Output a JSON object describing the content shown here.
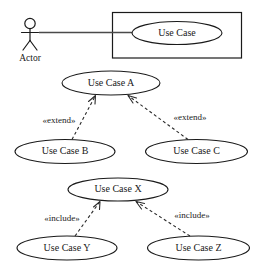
{
  "diagram": {
    "type": "use-case-diagram",
    "colors": {
      "background": "#ffffff",
      "stroke": "#1a1a1a",
      "association": "#4a4a4a",
      "dependency": "#2a2a2a"
    }
  },
  "section_actor": {
    "actor": {
      "name": "Actor",
      "label": "Actor"
    },
    "system": {
      "use_case": {
        "label": "Use Case"
      }
    },
    "association": {
      "from": "Actor",
      "to": "Use Case"
    }
  },
  "section_extend": {
    "base": {
      "label": "Use Case A"
    },
    "extensions": [
      {
        "label": "Use Case B",
        "stereotype": "«extend»"
      },
      {
        "label": "Use Case C",
        "stereotype": "«extend»"
      }
    ]
  },
  "section_include": {
    "base": {
      "label": "Use Case X"
    },
    "included": [
      {
        "label": "Use Case Y",
        "stereotype": "«include»"
      },
      {
        "label": "Use Case Z",
        "stereotype": "«include»"
      }
    ]
  }
}
